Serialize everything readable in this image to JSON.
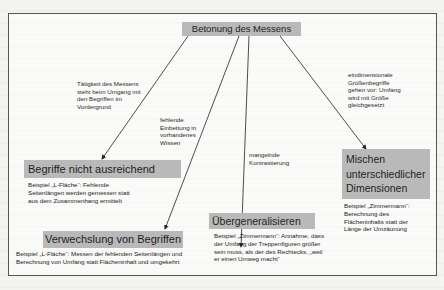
{
  "root": {
    "title": "Betonung des Messens"
  },
  "edges": [
    {
      "label": [
        "Tätigkeit des Messens",
        "steht beim Umgang mit",
        "den Begriffen im",
        "Vordergrund"
      ]
    },
    {
      "label": [
        "fehlende",
        "Einbettung in",
        "vorhandenes",
        "Wissen"
      ]
    },
    {
      "label": [
        "mangelnde",
        "Kontrastierung"
      ]
    },
    {
      "label": [
        "eindimensionale",
        "Größenbegriffe",
        "gehen vor: Umfang",
        "wird mit Größe",
        "gleichgesetzt"
      ]
    }
  ],
  "nodes": [
    {
      "title": "Begriffe nicht ausreichend",
      "example": [
        "Beispiel „L-Fläche“: Fehlende",
        "Seitenlängen werden gemessen statt",
        "aus dem Zusammenhang ermittelt"
      ]
    },
    {
      "title": "Verwechslung von Begriffen",
      "example": [
        "Beispiel „L-Fläche“: Messen der fehlenden Seitenlängen und",
        "Berechnung von Umfang statt Flächeninhalt und umgekehrt"
      ]
    },
    {
      "title": "Übergeneralisieren",
      "example": [
        "Beispiel „Zimmermann“: Annahme, dass",
        "der Umfang der Treppenfiguren größer",
        "sein muss, als der des Rechtecks, „weil",
        "er einen Umweg macht“"
      ]
    },
    {
      "title": [
        "Mischen",
        "unterschiedlicher",
        "Dimensionen"
      ],
      "example": [
        "Beispiel „Zimmermann“:",
        "Berechnung des",
        "Flächeninhalts statt der",
        "Länge der Umzäunung"
      ]
    }
  ]
}
